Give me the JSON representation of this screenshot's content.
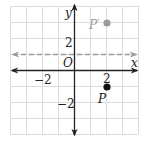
{
  "diagram": {
    "type": "coordinate-plane",
    "grid": {
      "x_min": -4,
      "x_max": 4,
      "y_min": -4,
      "y_max": 4,
      "cell_px": 16,
      "color": "#dcdcdc"
    },
    "axes": {
      "x_label": "x",
      "y_label": "y",
      "origin_label": "O",
      "color": "#222222"
    },
    "ticks": {
      "x_neg": "−2",
      "x_pos": "2",
      "y_pos": "2",
      "y_neg": "−2"
    },
    "reflection_line": {
      "equation": "y = 1",
      "style": "dashed",
      "color": "#9a9a9a"
    },
    "points": [
      {
        "label": "P",
        "x": 2,
        "y": -1,
        "color": "#111111"
      },
      {
        "label": "P′",
        "x": 2,
        "y": 3,
        "color": "#9a9a9a"
      }
    ]
  }
}
